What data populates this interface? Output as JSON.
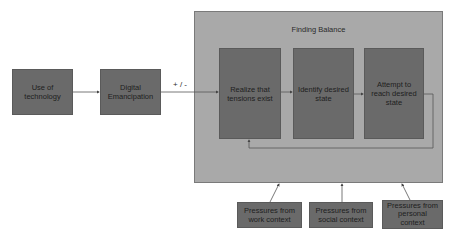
{
  "diagram": {
    "nodes": {
      "use_of_technology": "Use of technology",
      "digital_emancipation": "Digital Emancipation",
      "finding_balance": "Finding Balance",
      "realize_tensions": "Realize that tensions exist",
      "identify_state": "Identify desired state",
      "attempt_reach": "Attempt to reach desired state",
      "pressure_work": "Pressures from work context",
      "pressure_social": "Pressures from social context",
      "pressure_personal": "Pressures from personal context"
    },
    "edge_labels": {
      "emancipation_to_balance": "+ / -"
    },
    "edges": [
      {
        "from": "use_of_technology",
        "to": "digital_emancipation"
      },
      {
        "from": "digital_emancipation",
        "to": "finding_balance",
        "label": "+ / -"
      },
      {
        "from": "realize_tensions",
        "to": "identify_state"
      },
      {
        "from": "identify_state",
        "to": "attempt_reach"
      },
      {
        "from": "attempt_reach",
        "to": "realize_tensions",
        "type": "feedback"
      },
      {
        "from": "pressure_work",
        "to": "finding_balance"
      },
      {
        "from": "pressure_social",
        "to": "finding_balance"
      },
      {
        "from": "pressure_personal",
        "to": "finding_balance"
      }
    ],
    "colors": {
      "outer_fill": "#a9a9a9",
      "node_fill": "#6a6a6a",
      "line": "#555555"
    }
  }
}
